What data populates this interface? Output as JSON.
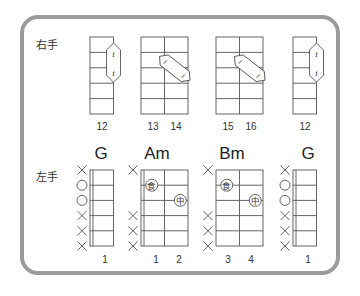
{
  "labels": {
    "right_hand": "右手",
    "left_hand": "左手"
  },
  "right_hand_diagrams": [
    {
      "x": 90,
      "cols": 1,
      "pick": {
        "type": "vertical",
        "col": 0,
        "from_row": 1,
        "to_row": 2,
        "glyph": "i"
      },
      "numbers": [
        {
          "text": "12",
          "cx": 102
        }
      ]
    },
    {
      "x": 141,
      "cols": 2,
      "pick": {
        "type": "diagonal",
        "glyph": "i"
      },
      "numbers": [
        {
          "text": "13",
          "cx": 153
        },
        {
          "text": "14",
          "cx": 176
        }
      ]
    },
    {
      "x": 216,
      "cols": 2,
      "pick": {
        "type": "diagonal",
        "glyph": "i"
      },
      "numbers": [
        {
          "text": "15",
          "cx": 228
        },
        {
          "text": "16",
          "cx": 251
        }
      ]
    },
    {
      "x": 293,
      "cols": 1,
      "pick": {
        "type": "vertical",
        "col": 0,
        "from_row": 1,
        "to_row": 2,
        "glyph": "i"
      },
      "numbers": [
        {
          "text": "12",
          "cx": 305
        }
      ]
    }
  ],
  "left_hand_chords": [
    {
      "name": "G",
      "name_cx": 101,
      "x": 90,
      "cols": 1,
      "nut": true,
      "strings": [
        "x",
        "o",
        "o",
        "x",
        "x",
        "x"
      ],
      "fingers": [],
      "numbers": [
        {
          "text": "1",
          "cx": 105
        }
      ]
    },
    {
      "name": "Am",
      "name_cx": 157,
      "x": 141,
      "cols": 2,
      "nut": true,
      "strings": [
        "x",
        "",
        "",
        "x",
        "x",
        "x"
      ],
      "fingers": [
        {
          "label": "食",
          "col": 0,
          "row": 1
        },
        {
          "label": "中",
          "col": 1,
          "row": 2
        }
      ],
      "numbers": [
        {
          "text": "1",
          "cx": 156
        },
        {
          "text": "2",
          "cx": 179
        }
      ]
    },
    {
      "name": "Bm",
      "name_cx": 232,
      "x": 216,
      "cols": 2,
      "nut": false,
      "strings": [
        "x",
        "",
        "",
        "x",
        "x",
        "x"
      ],
      "fingers": [
        {
          "label": "食",
          "col": 0,
          "row": 1
        },
        {
          "label": "中",
          "col": 1,
          "row": 2
        }
      ],
      "numbers": [
        {
          "text": "3",
          "cx": 228
        },
        {
          "text": "4",
          "cx": 251
        }
      ]
    },
    {
      "name": "G",
      "name_cx": 308,
      "x": 293,
      "cols": 1,
      "nut": true,
      "strings": [
        "x",
        "o",
        "o",
        "x",
        "x",
        "x"
      ],
      "fingers": [],
      "numbers": [
        {
          "text": "1",
          "cx": 308
        }
      ]
    }
  ],
  "colors": {
    "frame": "#9b9b9b",
    "line": "#555555",
    "text": "#222222"
  }
}
